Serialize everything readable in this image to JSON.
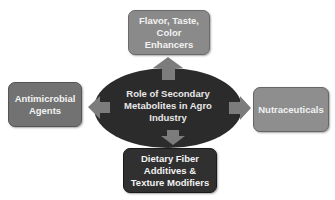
{
  "diagram": {
    "center": {
      "label": "Role of Secondary Metabolites in Agro Industry",
      "lines": [
        "Role of Secondary",
        "Metabolites in Agro",
        "Industry"
      ],
      "color": "#2b2b2b"
    },
    "nodes": {
      "top": {
        "label": "Flavor, Taste, Color Enhancers",
        "lines": [
          "Flavor, Taste,",
          "Color",
          "Enhancers"
        ],
        "color": "#8a8a8a"
      },
      "left": {
        "label": "Antimicrobial Agents",
        "lines": [
          "Antimicrobial",
          "Agents"
        ],
        "color": "#727272"
      },
      "right": {
        "label": "Nutraceuticals",
        "lines": [
          "Nutraceuticals"
        ],
        "color": "#8e8e8e"
      },
      "bottom": {
        "label": "Dietary Fiber Additives & Texture Modifiers",
        "lines": [
          "Dietary Fiber",
          "Additives &",
          "Texture Modifiers"
        ],
        "color": "#303030"
      }
    },
    "arrow_color": "#7c7c7c",
    "edges": [
      {
        "from": "center",
        "to": "top"
      },
      {
        "from": "center",
        "to": "left"
      },
      {
        "from": "center",
        "to": "right"
      },
      {
        "from": "center",
        "to": "bottom"
      }
    ]
  }
}
